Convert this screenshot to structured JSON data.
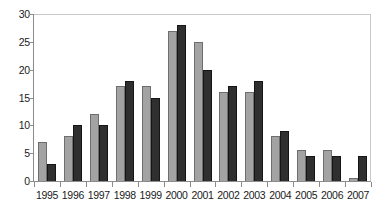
{
  "chart_data": {
    "type": "bar",
    "title": "",
    "subtitle": "",
    "xlabel": "",
    "ylabel": "",
    "categories": [
      "1995",
      "1996",
      "1997",
      "1998",
      "1999",
      "2000",
      "2001",
      "2002",
      "2003",
      "2004",
      "2005",
      "2006",
      "2007"
    ],
    "series": [
      {
        "name": "series-1",
        "color": "#a3a3a3",
        "values": [
          7,
          8,
          12,
          17,
          17,
          27,
          25,
          16,
          16,
          8,
          5.5,
          5.5,
          0.5
        ]
      },
      {
        "name": "series-2",
        "color": "#2f2f2f",
        "values": [
          3,
          10,
          10,
          18,
          15,
          28,
          20,
          17,
          18,
          9,
          4.5,
          4.5,
          4.5
        ]
      }
    ],
    "ylim": [
      0,
      30
    ],
    "yticks": [
      0,
      5,
      10,
      15,
      20,
      25,
      30
    ],
    "ytick_labels": [
      "0",
      "5",
      "10",
      "15",
      "20",
      "25",
      "30"
    ],
    "grid": false,
    "legend": "none",
    "axis_color": "#8c8c8c",
    "frame_color": "#c8c8c8",
    "background": "#ffffff"
  }
}
